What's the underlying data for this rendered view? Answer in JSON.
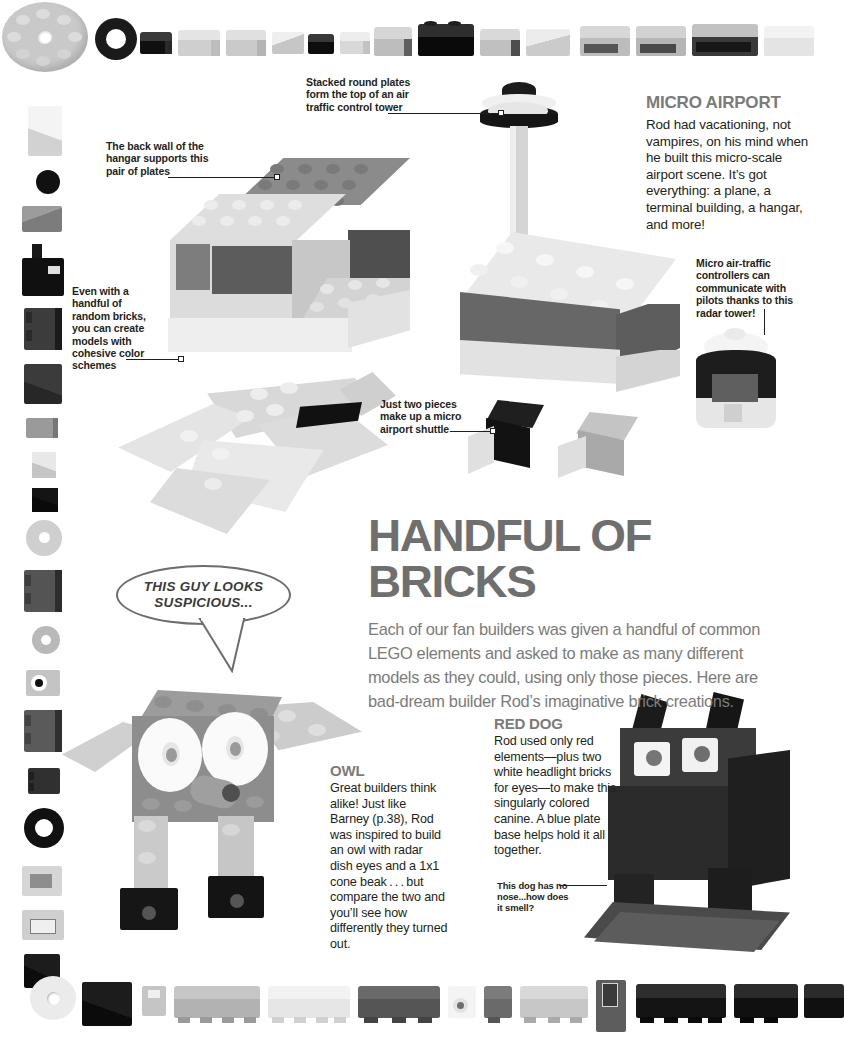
{
  "page": {
    "background_color": "#ffffff",
    "headline_color": "#6f6f6f",
    "body_color": "#231f20"
  },
  "headline": {
    "title": "HANDFUL OF BRICKS",
    "intro": "Each of our fan builders was given a handful of common LEGO elements and asked to make as many different models as they could, using only those pieces. Here are bad-dream builder Rod’s imaginative brick creations."
  },
  "sections": {
    "micro_airport": {
      "heading": "MICRO AIRPORT",
      "body": "Rod had vacationing, not vampires, on his mind when he built this micro-scale airport scene. It’s got everything: a plane, a terminal building, a hangar, and more!"
    },
    "owl": {
      "heading": "OWL",
      "body": "Great builders think alike! Just like Barney (p.38), Rod was inspired to build an owl with radar dish eyes and a 1x1 cone beak . . . but compare the two and you’ll see how differently they turned out."
    },
    "red_dog": {
      "heading": "RED DOG",
      "body": "Rod used only red elements—plus two white headlight bricks for eyes—to make this singularly colored canine. A blue plate base helps hold it all together."
    }
  },
  "callouts": {
    "tower_top": "Stacked round plates form the top of an air traffic control tower",
    "hangar_wall": "The back wall of the hangar supports this pair of plates",
    "color_schemes": "Even with a handful of random bricks, you can create models with cohesive color schemes",
    "radar_tower": "Micro air-traffic controllers can communicate with pilots thanks to this radar tower!",
    "shuttle": "Just two pieces make up a micro airport shuttle",
    "dog_nose": "This dog has no nose...how does it smell?"
  },
  "speech_bubble": {
    "text": "THIS GUY LOOKS SUSPICIOUS..."
  },
  "decor": {
    "top_strip_label": "lego-parts-top-strip",
    "left_strip_label": "lego-parts-left-strip",
    "bottom_strip_label": "lego-parts-bottom-strip"
  }
}
